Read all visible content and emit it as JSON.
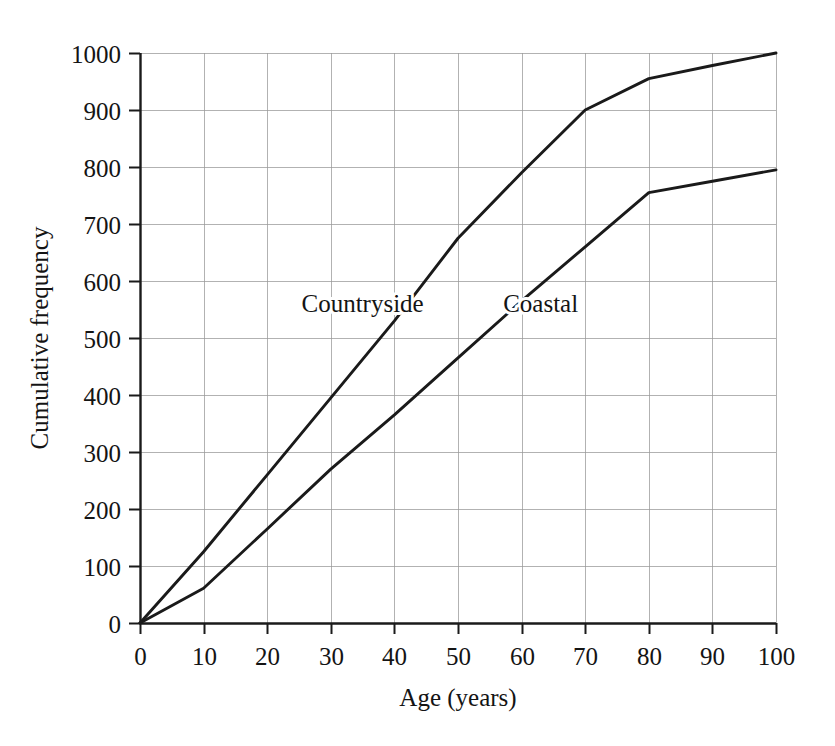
{
  "chart_data": {
    "type": "line",
    "title": "",
    "subtitle": "",
    "xlabel": "Age (years)",
    "ylabel": "Cumulative frequency",
    "xlim": [
      0,
      100
    ],
    "ylim": [
      0,
      1000
    ],
    "xticks": [
      0,
      10,
      20,
      30,
      40,
      50,
      60,
      70,
      80,
      90,
      100
    ],
    "yticks": [
      0,
      100,
      200,
      300,
      400,
      500,
      600,
      700,
      800,
      900,
      1000
    ],
    "xtick_labels": [
      "0",
      "10",
      "20",
      "30",
      "40",
      "50",
      "60",
      "70",
      "80",
      "90",
      "100"
    ],
    "ytick_labels": [
      "0",
      "100",
      "200",
      "300",
      "400",
      "500",
      "600",
      "700",
      "800",
      "900",
      "1000"
    ],
    "grid": true,
    "grid_color": "#999999",
    "legend": "inline-labels",
    "line_color": "#1a1a1a",
    "series": [
      {
        "name": "Countryside",
        "label_position": {
          "x": 35,
          "y": 545
        },
        "x": [
          0,
          10,
          20,
          30,
          40,
          50,
          60,
          70,
          80,
          90,
          100
        ],
        "values": [
          0,
          125,
          260,
          395,
          530,
          675,
          790,
          900,
          955,
          978,
          1000
        ]
      },
      {
        "name": "Coastal",
        "label_position": {
          "x": 63,
          "y": 545
        },
        "x": [
          0,
          10,
          20,
          30,
          40,
          50,
          60,
          70,
          80,
          90,
          100
        ],
        "values": [
          0,
          61,
          165,
          270,
          365,
          465,
          565,
          660,
          755,
          775,
          795
        ]
      }
    ],
    "annotations": [
      {
        "text": "Countryside",
        "x": 35,
        "y": 545
      },
      {
        "text": "Coastal",
        "x": 63,
        "y": 545
      }
    ]
  }
}
